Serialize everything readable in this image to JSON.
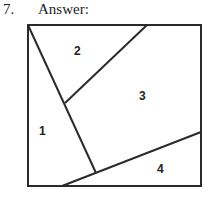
{
  "question": {
    "number": "7.",
    "label": "Answer:"
  },
  "figure": {
    "stroke_color": "#2a2a2a",
    "regions": [
      {
        "label": "1"
      },
      {
        "label": "2"
      },
      {
        "label": "3"
      },
      {
        "label": "4"
      }
    ]
  }
}
